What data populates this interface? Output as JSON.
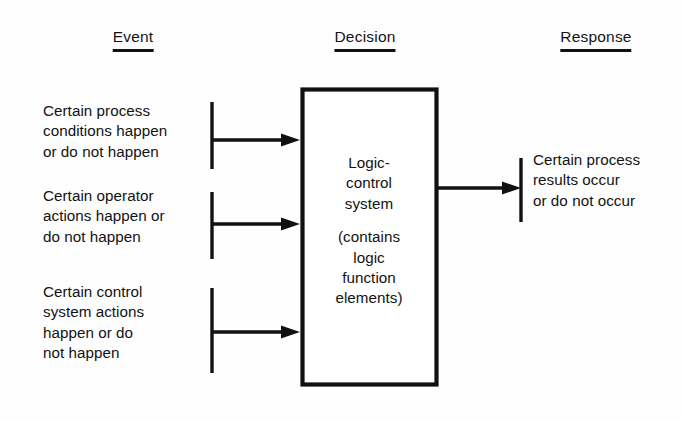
{
  "diagram": {
    "background_color": "#fefefe",
    "ink_color": "#111111",
    "columns": [
      {
        "id": "event",
        "label": "Event",
        "center_x": 133
      },
      {
        "id": "decision",
        "label": "Decision",
        "center_x": 365
      },
      {
        "id": "response",
        "label": "Response",
        "center_x": 596
      }
    ],
    "inputs": [
      {
        "id": "process-conditions",
        "lines": [
          "Certain process",
          "conditions happen",
          "or do not happen"
        ]
      },
      {
        "id": "operator-actions",
        "lines": [
          "Certain operator",
          "actions happen or",
          "do not happen"
        ]
      },
      {
        "id": "control-system-actions",
        "lines": [
          "Certain control",
          "system actions",
          "happen or do",
          "not happen"
        ]
      }
    ],
    "process_box": {
      "id": "logic-control-system",
      "title_lines": [
        "Logic-",
        "control",
        "system"
      ],
      "detail_lines": [
        "(contains",
        "logic",
        "function",
        "elements)"
      ]
    },
    "output": {
      "id": "process-results",
      "lines": [
        "Certain process",
        "results occur",
        "or do not occur"
      ]
    }
  }
}
